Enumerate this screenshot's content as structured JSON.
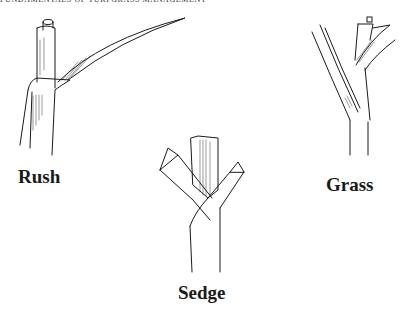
{
  "running_head": "FUNDAMENTALS OF TURFGRASS MANAGEMENT",
  "figure": {
    "panels": [
      {
        "id": "rush",
        "label": "Rush"
      },
      {
        "id": "sedge",
        "label": "Sedge"
      },
      {
        "id": "grass",
        "label": "Grass"
      }
    ]
  }
}
